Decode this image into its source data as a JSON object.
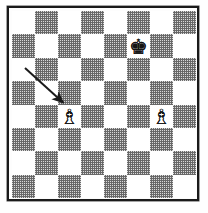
{
  "diagram": {
    "type": "chess-board",
    "orientation": "white-bottom",
    "files": [
      "a",
      "b",
      "c",
      "d",
      "e",
      "f",
      "g",
      "h"
    ],
    "ranks": [
      "8",
      "7",
      "6",
      "5",
      "4",
      "3",
      "2",
      "1"
    ],
    "light_square_color": "#ffffff",
    "dark_square_color": "#8a8a8a",
    "border_color": "#1a1a1a",
    "top_left_square_shade": "light",
    "squares": [
      [
        "light",
        "dark",
        "light",
        "dark",
        "light",
        "dark",
        "light",
        "dark"
      ],
      [
        "dark",
        "light",
        "dark",
        "light",
        "dark",
        "light",
        "dark",
        "light"
      ],
      [
        "light",
        "dark",
        "light",
        "dark",
        "light",
        "dark",
        "light",
        "dark"
      ],
      [
        "dark",
        "light",
        "dark",
        "light",
        "dark",
        "light",
        "dark",
        "light"
      ],
      [
        "light",
        "dark",
        "light",
        "dark",
        "light",
        "dark",
        "light",
        "dark"
      ],
      [
        "dark",
        "light",
        "dark",
        "light",
        "dark",
        "light",
        "dark",
        "light"
      ],
      [
        "light",
        "dark",
        "light",
        "dark",
        "light",
        "dark",
        "light",
        "dark"
      ],
      [
        "dark",
        "light",
        "dark",
        "light",
        "dark",
        "light",
        "dark",
        "light"
      ]
    ],
    "pieces": [
      {
        "square": "f7",
        "row": 1,
        "col": 5,
        "piece": "king",
        "color": "black",
        "glyph": "♚",
        "name": "black-king"
      },
      {
        "square": "c4",
        "row": 4,
        "col": 2,
        "piece": "bishop",
        "color": "white",
        "glyph": "♗",
        "name": "white-bishop-c4"
      },
      {
        "square": "g4",
        "row": 4,
        "col": 6,
        "piece": "bishop",
        "color": "white",
        "glyph": "♗",
        "name": "white-bishop-g4"
      }
    ],
    "annotations": [
      {
        "type": "arrow",
        "name": "move-arrow",
        "from_x": 25,
        "from_y": 68,
        "to_x": 67,
        "to_y": 106,
        "color": "#1a1a1a",
        "target_square": "c4",
        "description": "arrow pointing to the bishop on c4"
      }
    ]
  }
}
